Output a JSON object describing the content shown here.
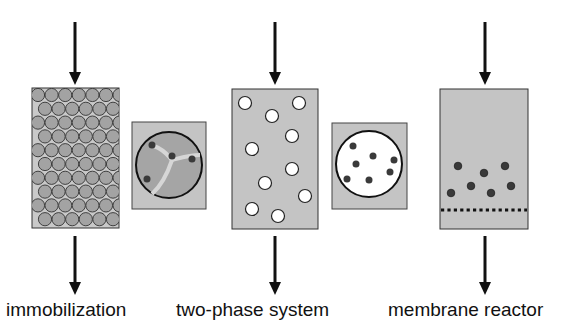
{
  "colors": {
    "background": "#ffffff",
    "reactor_fill": "#c4c4c4",
    "bead_fill": "#a3a3a3",
    "outline": "#1a1a1a",
    "enzyme_dot": "#3a3a3a",
    "droplet_fill": "#ffffff",
    "bead_channel": "#d9d9d9"
  },
  "panels": [
    {
      "id": "immobilization",
      "label": "immobilization",
      "icon": "packed-bed-reactor-icon",
      "detail_icon": "porous-bead-icon"
    },
    {
      "id": "two-phase",
      "label": "two-phase system",
      "icon": "droplet-reactor-icon",
      "detail_icon": "droplet-with-enzymes-icon"
    },
    {
      "id": "membrane",
      "label": "membrane reactor",
      "icon": "membrane-reactor-icon"
    }
  ],
  "flow": {
    "inlet": "arrow-down-icon",
    "outlet": "arrow-down-icon"
  }
}
